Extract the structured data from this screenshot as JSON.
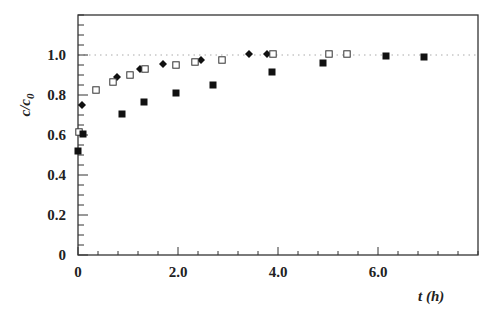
{
  "chart_data": {
    "type": "scatter",
    "title": "",
    "xlabel": "t (h)",
    "ylabel": "c/c0",
    "ylabel_main": "c/c",
    "ylabel_sub": "0",
    "xlim": [
      0,
      8.0
    ],
    "ylim": [
      0,
      1.2
    ],
    "x_ticks": [
      0,
      2.0,
      4.0,
      6.0
    ],
    "x_tick_labels": [
      "0",
      "2.0",
      "4.0",
      "6.0"
    ],
    "x_minor_step": 0.4,
    "y_ticks": [
      0,
      0.2,
      0.4,
      0.6,
      0.8,
      1.0
    ],
    "y_tick_labels": [
      "0",
      "0.2",
      "0.4",
      "0.6",
      "0.8",
      "1.0"
    ],
    "y_minor_step": 0.05,
    "grid": false,
    "reference_line": {
      "y": 1.0,
      "style": "dotted"
    },
    "legend": null,
    "series": [
      {
        "name": "filled-diamond",
        "marker": "diamond-filled",
        "x": [
          0.08,
          0.78,
          1.24,
          1.7,
          2.46,
          3.42,
          3.78
        ],
        "y": [
          0.75,
          0.89,
          0.93,
          0.955,
          0.975,
          1.005,
          1.005
        ]
      },
      {
        "name": "open-square",
        "marker": "square-open",
        "x": [
          0.02,
          0.36,
          0.7,
          1.04,
          1.34,
          1.96,
          2.34,
          2.88,
          3.9,
          5.02,
          5.38
        ],
        "y": [
          0.615,
          0.825,
          0.865,
          0.9,
          0.93,
          0.95,
          0.965,
          0.975,
          1.005,
          1.005,
          1.005
        ]
      },
      {
        "name": "filled-square",
        "marker": "square-filled",
        "x": [
          0.0,
          0.1,
          0.88,
          1.32,
          1.96,
          2.7,
          3.88,
          4.9,
          6.16,
          6.92
        ],
        "y": [
          0.52,
          0.605,
          0.705,
          0.765,
          0.81,
          0.85,
          0.915,
          0.96,
          0.995,
          0.99
        ]
      }
    ]
  }
}
